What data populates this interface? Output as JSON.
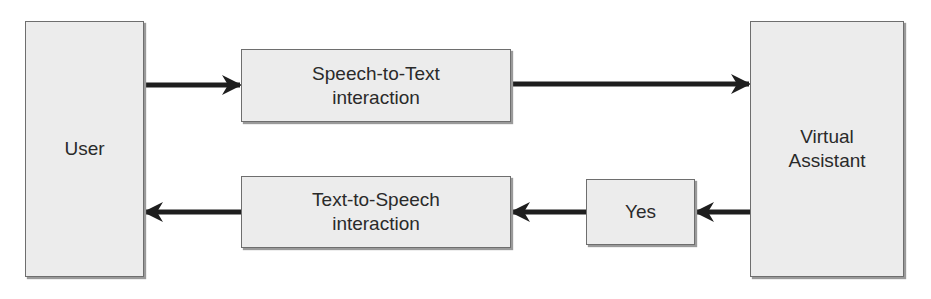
{
  "diagram": {
    "type": "flowchart",
    "nodes": {
      "user": {
        "label": "User"
      },
      "stt": {
        "line1": "Speech-to-Text",
        "line2": "interaction"
      },
      "va": {
        "line1": "Virtual",
        "line2": "Assistant"
      },
      "tts": {
        "line1": "Text-to-Speech",
        "line2": "interaction"
      },
      "yes": {
        "label": "Yes"
      }
    },
    "edges": [
      {
        "from": "User",
        "to": "Speech-to-Text interaction"
      },
      {
        "from": "Speech-to-Text interaction",
        "to": "Virtual Assistant"
      },
      {
        "from": "Virtual Assistant",
        "to": "Yes"
      },
      {
        "from": "Yes",
        "to": "Text-to-Speech interaction"
      },
      {
        "from": "Text-to-Speech interaction",
        "to": "User"
      }
    ],
    "colors": {
      "box_fill": "#ececec",
      "box_border": "#6e6e6e",
      "arrow": "#1e1e1e",
      "text": "#2a2a2a"
    }
  }
}
